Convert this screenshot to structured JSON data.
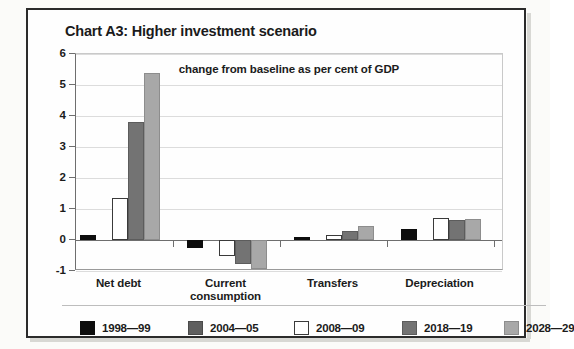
{
  "chart_data": {
    "type": "bar",
    "title": "Chart A3: Higher investment scenario",
    "subtitle": "change from baseline as per cent of GDP",
    "xlabel": "",
    "ylabel": "",
    "ylim": [
      -1,
      6
    ],
    "yticks": [
      6,
      5,
      4,
      3,
      2,
      1,
      0,
      -1
    ],
    "ytick_labels": [
      "6",
      "5",
      "4",
      "3",
      "2",
      "1",
      "0",
      "-1"
    ],
    "grid": true,
    "legend_position": "bottom",
    "categories": [
      "Net debt",
      "Current consumption",
      "Transfers",
      "Depreciation"
    ],
    "category_label_lines": [
      [
        "Net debt"
      ],
      [
        "Current",
        "consumption"
      ],
      [
        "Transfers"
      ],
      [
        "Depreciation"
      ]
    ],
    "series": [
      {
        "name": "1998—99",
        "color": "#0d0d0d",
        "values": [
          0.15,
          -0.26,
          0.1,
          0.35
        ]
      },
      {
        "name": "2004—05",
        "color": "#5f5f5f",
        "values": [
          0.0,
          0.0,
          0.0,
          0.0
        ]
      },
      {
        "name": "2008—09",
        "color": "#ffffff",
        "values": [
          1.35,
          -0.52,
          0.15,
          0.7
        ]
      },
      {
        "name": "2018—19",
        "color": "#737373",
        "values": [
          3.8,
          -0.77,
          0.3,
          0.65
        ]
      },
      {
        "name": "2028—29",
        "color": "#a8a8a8",
        "values": [
          5.4,
          -0.94,
          0.45,
          0.68
        ]
      }
    ]
  },
  "legend": {
    "items": [
      {
        "label": "1998—99",
        "swatch": "s0"
      },
      {
        "label": "2004—05",
        "swatch": "s1"
      },
      {
        "label": "2008—09",
        "swatch": "s2"
      },
      {
        "label": "2018—19",
        "swatch": "s3"
      },
      {
        "label": "2028—29",
        "swatch": "s4"
      }
    ]
  }
}
